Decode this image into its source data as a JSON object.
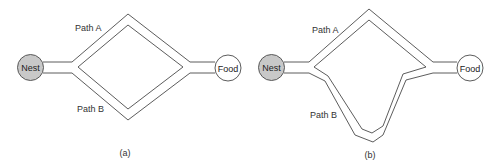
{
  "panels": [
    {
      "id": "a",
      "caption": "(a)",
      "nodes": {
        "nest": "Nest",
        "food": "Food"
      },
      "paths": [
        {
          "name": "Path A",
          "shape": "symmetric upper branch"
        },
        {
          "name": "Path B",
          "shape": "symmetric lower branch"
        }
      ]
    },
    {
      "id": "b",
      "caption": "(b)",
      "nodes": {
        "nest": "Nest",
        "food": "Food"
      },
      "paths": [
        {
          "name": "Path A",
          "shape": "short upper branch"
        },
        {
          "name": "Path B",
          "shape": "longer deep lower branch"
        }
      ]
    }
  ],
  "colors": {
    "nest_fill": "#c8c8c8",
    "food_fill": "#ffffff",
    "stroke": "#4a4a4a"
  }
}
